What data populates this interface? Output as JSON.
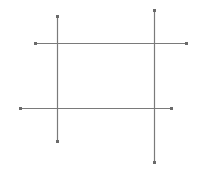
{
  "diagram": {
    "width": 201,
    "height": 173,
    "background": "#ffffff",
    "line_color": "#7a7a7a",
    "marker_color": "#6a6a6a",
    "line_width": 1.2,
    "marker_size": 3,
    "lines": [
      {
        "id": "vertical-left",
        "x1": 57,
        "y1": 16,
        "x2": 57,
        "y2": 141
      },
      {
        "id": "vertical-right",
        "x1": 154,
        "y1": 10,
        "x2": 154,
        "y2": 162
      },
      {
        "id": "horizontal-top",
        "x1": 35,
        "y1": 43,
        "x2": 186,
        "y2": 43
      },
      {
        "id": "horizontal-bottom",
        "x1": 20,
        "y1": 108,
        "x2": 171,
        "y2": 108
      }
    ]
  }
}
